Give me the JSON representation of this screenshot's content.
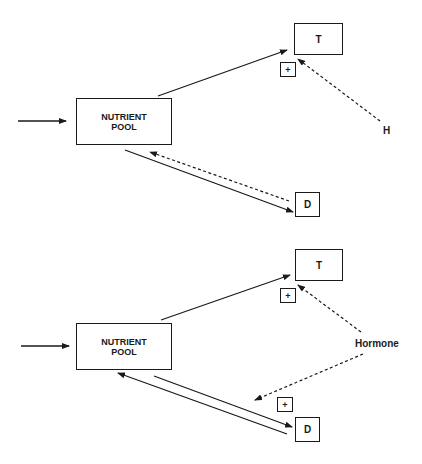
{
  "diagrams": [
    {
      "id": "top",
      "nodes": {
        "pool": "NUTRIENT\nPOOL",
        "pool_line1": "NUTRIENT",
        "pool_line2": "POOL",
        "t": "T",
        "d": "D"
      },
      "regulator": "H",
      "signs": {
        "t": "+"
      },
      "edges": [
        {
          "from": "input",
          "to": "pool",
          "style": "solid"
        },
        {
          "from": "pool",
          "to": "T",
          "style": "solid"
        },
        {
          "from": "pool",
          "to": "D",
          "style": "solid"
        },
        {
          "from": "D",
          "to": "pool",
          "style": "dashed"
        },
        {
          "from": "H",
          "to": "T",
          "style": "dashed",
          "sign": "+"
        }
      ]
    },
    {
      "id": "bottom",
      "nodes": {
        "pool_line1": "NUTRIENT",
        "pool_line2": "POOL",
        "t": "T",
        "d": "D"
      },
      "regulator": "Hormone",
      "signs": {
        "t": "+",
        "d": "+"
      },
      "edges": [
        {
          "from": "input",
          "to": "pool",
          "style": "solid"
        },
        {
          "from": "pool",
          "to": "T",
          "style": "solid"
        },
        {
          "from": "pool",
          "to": "D",
          "style": "solid"
        },
        {
          "from": "D",
          "to": "pool",
          "style": "solid"
        },
        {
          "from": "Hormone",
          "to": "T",
          "style": "dashed",
          "sign": "+"
        },
        {
          "from": "Hormone",
          "to": "D",
          "style": "dashed",
          "sign": "+"
        }
      ]
    }
  ],
  "colors": {
    "stroke": "#1a1a1a",
    "background": "#ffffff"
  }
}
